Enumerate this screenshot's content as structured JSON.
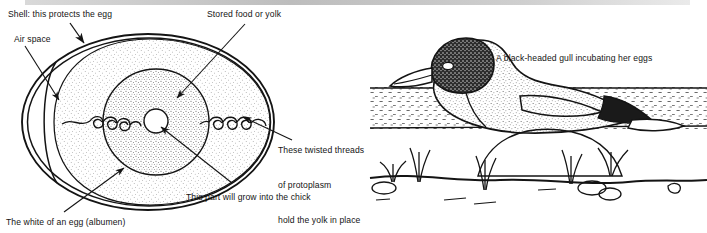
{
  "figure": {
    "background_color": "#ffffff",
    "ink_color": "#1a1a1a"
  },
  "egg_panel": {
    "name": "egg-cross-section-diagram",
    "labels": {
      "shell": "Shell: this protects the egg",
      "air_space": "Air space",
      "yolk": "Stored food or yolk",
      "chalazae": "These twisted threads\nof protoplasm\nhold the yolk in place",
      "chalazae_line_1": "These twisted threads",
      "chalazae_line_2": "of protoplasm",
      "chalazae_line_3": "hold the yolk in place",
      "germinal_disc": "This part will grow into the chick",
      "albumen": "The white of an egg (albumen)"
    },
    "parts": [
      "shell",
      "air-space",
      "albumen",
      "yolk",
      "germinal-disc",
      "chalaza-left",
      "chalaza-right"
    ]
  },
  "gull_panel": {
    "name": "black-headed-gull-illustration",
    "caption": "A black-headed gull incubating her eggs",
    "parts": [
      "gull-body",
      "gull-head",
      "gull-beak",
      "gull-eye",
      "gull-wing",
      "gull-tail",
      "nest-ground",
      "grass-tufts",
      "pebbles"
    ]
  }
}
